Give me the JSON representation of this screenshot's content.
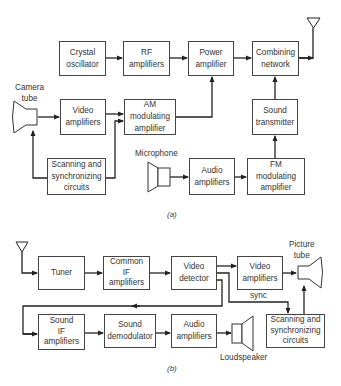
{
  "diagram_a": {
    "caption": "(a)",
    "blocks": {
      "crystal_oscillator": "Crystal\noscillator",
      "rf_amplifiers": "RF\namplifiers",
      "power_amplifier": "Power\namplifier",
      "combining_network": "Combining\nnetwork",
      "video_amplifiers": "Video\namplifiers",
      "am_modulating_amplifier": "AM\nmodulating\namplifier",
      "sound_transmitter": "Sound\ntransmitter",
      "scanning_sync": "Scanning and\nsynchronizing\ncircuits",
      "audio_amplifiers": "Audio\namplifiers",
      "fm_modulating_amplifier": "FM\nmodulating\namplifier"
    },
    "labels": {
      "camera_tube": "Camera\ntube",
      "microphone": "Microphone"
    }
  },
  "diagram_b": {
    "caption": "(b)",
    "blocks": {
      "tuner": "Tuner",
      "common_if_amplifiers": "Common\nIF\namplifiers",
      "video_detector": "Video\ndetector",
      "video_amplifiers": "Video\namplifiers",
      "scanning_sync": "Scanning and\nsynchronizing\ncircuits",
      "sound_if_amplifiers": "Sound\nIF\namplifiers",
      "sound_demodulator": "Sound\ndemodulator",
      "audio_amplifiers": "Audio\namplifiers"
    },
    "labels": {
      "picture_tube": "Picture\ntube",
      "sync": "sync",
      "loudspeaker": "Loudspeaker"
    }
  },
  "colors": {
    "line": "#222222",
    "box_border": "#444444",
    "text": "#333333"
  }
}
